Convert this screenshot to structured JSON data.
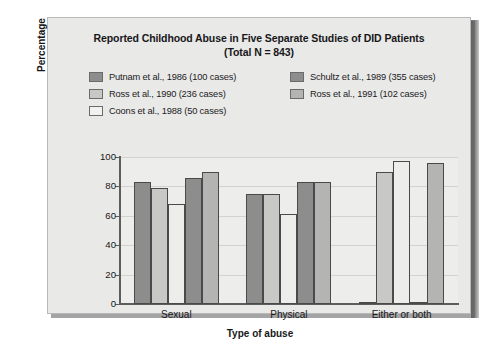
{
  "chart_data": {
    "type": "bar",
    "title": "Reported Childhood Abuse in Five Separate Studies of DID Patients (Total N = 843)",
    "title_line1": "Reported Childhood Abuse in Five Separate Studies of DID Patients",
    "title_line2": "(Total N = 843)",
    "xlabel": "Type of abuse",
    "ylabel": "Percentage",
    "ylim": [
      0,
      100
    ],
    "yticks": [
      0,
      20,
      40,
      60,
      80,
      100
    ],
    "grid": true,
    "legend_position": "top",
    "categories": [
      "Sexual",
      "Physical",
      "Either or both"
    ],
    "series": [
      {
        "name": "Putnam et al., 1986 (100 cases)",
        "color": "#8d8d8d",
        "values": [
          83,
          75,
          1
        ]
      },
      {
        "name": "Ross et al., 1990 (236 cases)",
        "color": "#c8c8c6",
        "values": [
          79,
          75,
          90
        ]
      },
      {
        "name": "Coons et al., 1988 (50 cases)",
        "color": "#ededeb",
        "values": [
          68,
          61,
          97
        ]
      },
      {
        "name": "Schultz et al., 1989 (355 cases)",
        "color": "#8d8d8d",
        "values": [
          86,
          83,
          1
        ]
      },
      {
        "name": "Ross et al., 1991 (102 cases)",
        "color": "#b4b4b2",
        "values": [
          90,
          83,
          96
        ]
      }
    ]
  },
  "legend": {
    "items": [
      {
        "label": "Putnam et al., 1986 (100 cases)",
        "color": "#8d8d8d"
      },
      {
        "label": "Ross et al., 1990 (236 cases)",
        "color": "#c8c8c6"
      },
      {
        "label": "Coons et al., 1988 (50 cases)",
        "color": "#f2f2f0"
      },
      {
        "label": "Schultz et al., 1989 (355 cases)",
        "color": "#8d8d8d"
      },
      {
        "label": "Ross et al., 1991 (102 cases)",
        "color": "#b4b4b2"
      }
    ]
  },
  "colors": {
    "panel_background": "#e9e9e7",
    "plot_background": "#ededeb",
    "axis": "#5d5d5d",
    "gridline": "#d2d2d0",
    "text": "#17171a"
  }
}
